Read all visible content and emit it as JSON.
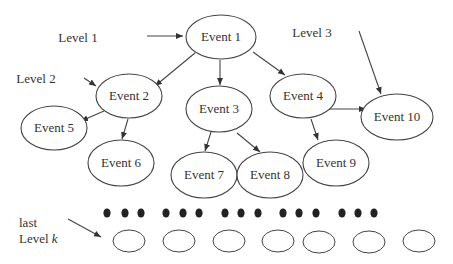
{
  "diagram": {
    "type": "event-tree",
    "levels": [
      {
        "id": "level1",
        "label": "Level 1",
        "x": 78,
        "y": 42
      },
      {
        "id": "level2",
        "label": "Level 2",
        "x": 36,
        "y": 83
      },
      {
        "id": "level3",
        "label": "Level 3",
        "x": 312,
        "y": 37
      }
    ],
    "last_level": {
      "line1": "last",
      "line2_prefix": "Level ",
      "line2_var": "k",
      "x": 19,
      "y": 227
    },
    "nodes": [
      {
        "id": "e1",
        "label": "Event 1",
        "cx": 221,
        "cy": 37,
        "rx": 35,
        "ry": 22
      },
      {
        "id": "e2",
        "label": "Event 2",
        "cx": 129,
        "cy": 96,
        "rx": 33,
        "ry": 22
      },
      {
        "id": "e3",
        "label": "Event 3",
        "cx": 219,
        "cy": 109,
        "rx": 33,
        "ry": 23
      },
      {
        "id": "e4",
        "label": "Event 4",
        "cx": 303,
        "cy": 96,
        "rx": 33,
        "ry": 22
      },
      {
        "id": "e5",
        "label": "Event 5",
        "cx": 54,
        "cy": 128,
        "rx": 33,
        "ry": 22
      },
      {
        "id": "e6",
        "label": "Event 6",
        "cx": 121,
        "cy": 163,
        "rx": 33,
        "ry": 23
      },
      {
        "id": "e7",
        "label": "Event 7",
        "cx": 204,
        "cy": 175,
        "rx": 33,
        "ry": 23
      },
      {
        "id": "e8",
        "label": "Event 8",
        "cx": 270,
        "cy": 175,
        "rx": 33,
        "ry": 23
      },
      {
        "id": "e9",
        "label": "Event 9",
        "cx": 336,
        "cy": 163,
        "rx": 33,
        "ry": 23
      },
      {
        "id": "e10",
        "label": "Event 10",
        "cx": 397,
        "cy": 117,
        "rx": 36,
        "ry": 23
      }
    ],
    "edges": [
      {
        "from": "e1",
        "to": "e2",
        "x1": 195,
        "y1": 53,
        "x2": 155,
        "y2": 86
      },
      {
        "from": "e1",
        "to": "e3",
        "x1": 220,
        "y1": 60,
        "x2": 220,
        "y2": 85
      },
      {
        "from": "e1",
        "to": "e4",
        "x1": 253,
        "y1": 52,
        "x2": 285,
        "y2": 75
      },
      {
        "from": "e2",
        "to": "e5",
        "x1": 104,
        "y1": 111,
        "x2": 81,
        "y2": 121
      },
      {
        "from": "e2",
        "to": "e6",
        "x1": 128,
        "y1": 119,
        "x2": 122,
        "y2": 139
      },
      {
        "from": "e3",
        "to": "e7",
        "x1": 211,
        "y1": 132,
        "x2": 205,
        "y2": 151
      },
      {
        "from": "e3",
        "to": "e8",
        "x1": 237,
        "y1": 133,
        "x2": 260,
        "y2": 152
      },
      {
        "from": "e4",
        "to": "e9",
        "x1": 311,
        "y1": 119,
        "x2": 318,
        "y2": 140
      },
      {
        "from": "e4",
        "to": "e10",
        "x1": 329,
        "y1": 109,
        "x2": 366,
        "y2": 109
      }
    ],
    "pointer_arrows": [
      {
        "id": "level1-arrow",
        "x1": 147,
        "y1": 36,
        "x2": 183,
        "y2": 36
      },
      {
        "id": "level2-arrow",
        "x1": 84,
        "y1": 78,
        "x2": 96,
        "y2": 86
      },
      {
        "id": "level3-arrow",
        "x1": 359,
        "y1": 31,
        "x2": 381,
        "y2": 94
      },
      {
        "id": "last-level-arrow",
        "x1": 68,
        "y1": 219,
        "x2": 101,
        "y2": 237
      }
    ],
    "ellipsis_dots": {
      "y": 213,
      "r": 3.6,
      "groups": [
        [
          107,
          125,
          141
        ],
        [
          166,
          183,
          199
        ],
        [
          225,
          241,
          258
        ],
        [
          283,
          299,
          316
        ],
        [
          342,
          358,
          374
        ]
      ]
    },
    "last_level_nodes": [
      {
        "cx": 129,
        "cy": 241,
        "rx": 16,
        "ry": 11
      },
      {
        "cx": 179,
        "cy": 241,
        "rx": 16,
        "ry": 11
      },
      {
        "cx": 229,
        "cy": 241,
        "rx": 16,
        "ry": 11
      },
      {
        "cx": 278,
        "cy": 241,
        "rx": 16,
        "ry": 11
      },
      {
        "cx": 319,
        "cy": 242,
        "rx": 16,
        "ry": 11
      },
      {
        "cx": 369,
        "cy": 242,
        "rx": 16,
        "ry": 11
      },
      {
        "cx": 419,
        "cy": 241,
        "rx": 16,
        "ry": 11
      }
    ],
    "colors": {
      "stroke": "#444444",
      "text": "#333333",
      "dot": "#222222",
      "background": "#ffffff"
    }
  }
}
